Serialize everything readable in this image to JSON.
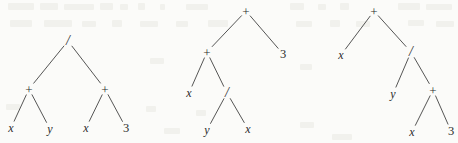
{
  "figure": {
    "name": "expression-trees",
    "background_color": "#fbfbf9",
    "ink_color": "#2b2b2b",
    "width": 458,
    "height": 143
  },
  "trees": [
    {
      "id": "tree-1",
      "expression": "(x + y) / (x + 3)",
      "nodes": [
        {
          "id": "t1-root",
          "label": "/",
          "kind": "operator",
          "x": 68,
          "y": 41
        },
        {
          "id": "t1-plus-l",
          "label": "+",
          "kind": "operator",
          "x": 29,
          "y": 89
        },
        {
          "id": "t1-plus-r",
          "label": "+",
          "kind": "operator",
          "x": 105,
          "y": 89
        },
        {
          "id": "t1-x1",
          "label": "x",
          "kind": "variable",
          "x": 11,
          "y": 128
        },
        {
          "id": "t1-y1",
          "label": "y",
          "kind": "variable",
          "x": 50,
          "y": 129
        },
        {
          "id": "t1-x2",
          "label": "x",
          "kind": "variable",
          "x": 86,
          "y": 128
        },
        {
          "id": "t1-3",
          "label": "3",
          "kind": "constant",
          "x": 126,
          "y": 128
        }
      ],
      "edges": [
        {
          "from": "t1-root",
          "to": "t1-plus-l"
        },
        {
          "from": "t1-root",
          "to": "t1-plus-r"
        },
        {
          "from": "t1-plus-l",
          "to": "t1-x1"
        },
        {
          "from": "t1-plus-l",
          "to": "t1-y1"
        },
        {
          "from": "t1-plus-r",
          "to": "t1-x2"
        },
        {
          "from": "t1-plus-r",
          "to": "t1-3"
        }
      ]
    },
    {
      "id": "tree-2",
      "expression": "(x + (y / x)) + 3",
      "nodes": [
        {
          "id": "t2-root",
          "label": "+",
          "kind": "operator",
          "x": 246,
          "y": 11
        },
        {
          "id": "t2-plus",
          "label": "+",
          "kind": "operator",
          "x": 207,
          "y": 52
        },
        {
          "id": "t2-3",
          "label": "3",
          "kind": "constant",
          "x": 283,
          "y": 54
        },
        {
          "id": "t2-x1",
          "label": "x",
          "kind": "variable",
          "x": 189,
          "y": 93
        },
        {
          "id": "t2-slash",
          "label": "/",
          "kind": "operator",
          "x": 227,
          "y": 93
        },
        {
          "id": "t2-y",
          "label": "y",
          "kind": "variable",
          "x": 207,
          "y": 130
        },
        {
          "id": "t2-x2",
          "label": "x",
          "kind": "variable",
          "x": 248,
          "y": 129
        }
      ],
      "edges": [
        {
          "from": "t2-root",
          "to": "t2-plus"
        },
        {
          "from": "t2-root",
          "to": "t2-3"
        },
        {
          "from": "t2-plus",
          "to": "t2-x1"
        },
        {
          "from": "t2-plus",
          "to": "t2-slash"
        },
        {
          "from": "t2-slash",
          "to": "t2-y"
        },
        {
          "from": "t2-slash",
          "to": "t2-x2"
        }
      ]
    },
    {
      "id": "tree-3",
      "expression": "x + (y / (x + 3))",
      "nodes": [
        {
          "id": "t3-root",
          "label": "+",
          "kind": "operator",
          "x": 374,
          "y": 11
        },
        {
          "id": "t3-x1",
          "label": "x",
          "kind": "variable",
          "x": 341,
          "y": 55
        },
        {
          "id": "t3-slash",
          "label": "/",
          "kind": "operator",
          "x": 411,
          "y": 52
        },
        {
          "id": "t3-y",
          "label": "y",
          "kind": "variable",
          "x": 393,
          "y": 94
        },
        {
          "id": "t3-plus",
          "label": "+",
          "kind": "operator",
          "x": 433,
          "y": 90
        },
        {
          "id": "t3-x2",
          "label": "x",
          "kind": "variable",
          "x": 412,
          "y": 132
        },
        {
          "id": "t3-3",
          "label": "3",
          "kind": "constant",
          "x": 451,
          "y": 131
        }
      ],
      "edges": [
        {
          "from": "t3-root",
          "to": "t3-x1"
        },
        {
          "from": "t3-root",
          "to": "t3-slash"
        },
        {
          "from": "t3-slash",
          "to": "t3-y"
        },
        {
          "from": "t3-slash",
          "to": "t3-plus"
        },
        {
          "from": "t3-plus",
          "to": "t3-x2"
        },
        {
          "from": "t3-plus",
          "to": "t3-3"
        }
      ]
    }
  ],
  "bleed_marks": [
    {
      "x": 8,
      "y": 3,
      "w": 26,
      "h": 7
    },
    {
      "x": 40,
      "y": 3,
      "w": 18,
      "h": 7
    },
    {
      "x": 64,
      "y": 4,
      "w": 30,
      "h": 6
    },
    {
      "x": 100,
      "y": 3,
      "w": 13,
      "h": 7
    },
    {
      "x": 120,
      "y": 4,
      "w": 8,
      "h": 6
    },
    {
      "x": 138,
      "y": 3,
      "w": 7,
      "h": 7
    },
    {
      "x": 160,
      "y": 4,
      "w": 5,
      "h": 6
    },
    {
      "x": 186,
      "y": 4,
      "w": 22,
      "h": 6
    },
    {
      "x": 290,
      "y": 3,
      "w": 14,
      "h": 7
    },
    {
      "x": 318,
      "y": 4,
      "w": 8,
      "h": 6
    },
    {
      "x": 340,
      "y": 3,
      "w": 9,
      "h": 7
    },
    {
      "x": 398,
      "y": 3,
      "w": 22,
      "h": 7
    },
    {
      "x": 426,
      "y": 4,
      "w": 26,
      "h": 6
    },
    {
      "x": 10,
      "y": 20,
      "w": 22,
      "h": 7
    },
    {
      "x": 44,
      "y": 20,
      "w": 28,
      "h": 7
    },
    {
      "x": 82,
      "y": 21,
      "w": 14,
      "h": 6
    },
    {
      "x": 112,
      "y": 20,
      "w": 10,
      "h": 7
    },
    {
      "x": 140,
      "y": 21,
      "w": 18,
      "h": 6
    },
    {
      "x": 176,
      "y": 21,
      "w": 12,
      "h": 6
    },
    {
      "x": 208,
      "y": 20,
      "w": 20,
      "h": 7
    },
    {
      "x": 296,
      "y": 21,
      "w": 16,
      "h": 6
    },
    {
      "x": 330,
      "y": 20,
      "w": 10,
      "h": 7
    },
    {
      "x": 356,
      "y": 21,
      "w": 14,
      "h": 6
    },
    {
      "x": 408,
      "y": 20,
      "w": 16,
      "h": 6
    },
    {
      "x": 436,
      "y": 21,
      "w": 18,
      "h": 6
    },
    {
      "x": 150,
      "y": 58,
      "w": 14,
      "h": 6
    },
    {
      "x": 300,
      "y": 64,
      "w": 12,
      "h": 6
    },
    {
      "x": 6,
      "y": 104,
      "w": 14,
      "h": 6
    },
    {
      "x": 146,
      "y": 106,
      "w": 10,
      "h": 6
    },
    {
      "x": 164,
      "y": 128,
      "w": 16,
      "h": 6
    },
    {
      "x": 196,
      "y": 110,
      "w": 10,
      "h": 6
    },
    {
      "x": 300,
      "y": 122,
      "w": 14,
      "h": 6
    },
    {
      "x": 332,
      "y": 134,
      "w": 20,
      "h": 6
    }
  ]
}
